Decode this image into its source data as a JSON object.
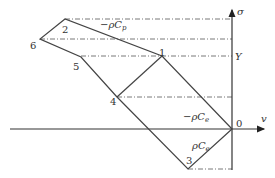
{
  "diagram": {
    "axes": {
      "horizontal_label": "v",
      "vertical_label": "σ",
      "origin_label": "0",
      "tick_label_Y": "Y"
    },
    "points": [
      {
        "id": "0",
        "label": "0"
      },
      {
        "id": "1",
        "label": "1"
      },
      {
        "id": "2",
        "label": "2"
      },
      {
        "id": "3",
        "label": "3"
      },
      {
        "id": "4",
        "label": "4"
      },
      {
        "id": "5",
        "label": "5"
      },
      {
        "id": "6",
        "label": "6"
      }
    ],
    "slope_labels": {
      "plastic": "−ρC",
      "plastic_sub": "p",
      "elastic_neg": "−ρC",
      "elastic_neg_sub": "e",
      "elastic_pos": "ρC",
      "elastic_pos_sub": "e"
    }
  }
}
